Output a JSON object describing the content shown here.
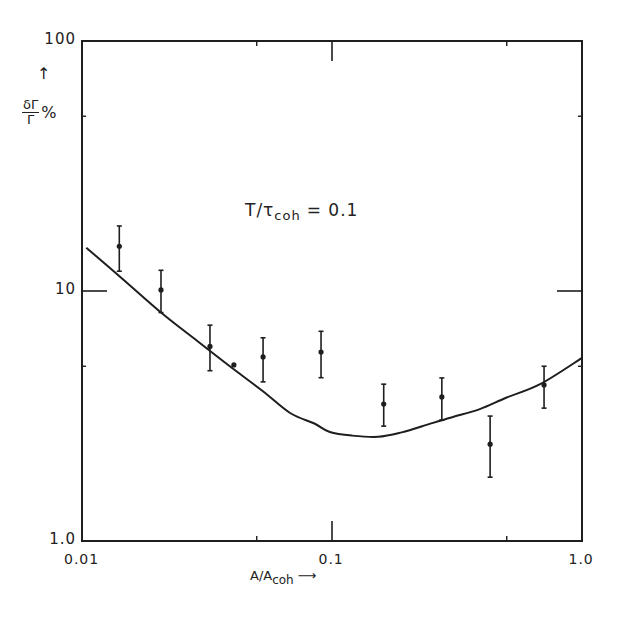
{
  "chart_data": {
    "type": "scatter",
    "title": "",
    "annotation": {
      "text": "T/τ",
      "sub": "coh",
      "suffix": "= 0.1"
    },
    "xlabel": {
      "text": "A/A",
      "sub": "coh",
      "arrow": "⟶"
    },
    "ylabel": {
      "numerator": "δΓ",
      "denominator": "Γ",
      "suffix": "%",
      "arrow": "↑"
    },
    "xscale": "log",
    "yscale": "log",
    "xlim": [
      0.01,
      1.0
    ],
    "ylim": [
      1.0,
      100
    ],
    "xticks": [
      {
        "value": 0.01,
        "label": "0.01"
      },
      {
        "value": 0.1,
        "label": "0.1"
      },
      {
        "value": 1.0,
        "label": "1.0"
      }
    ],
    "yticks": [
      {
        "value": 1.0,
        "label": "1.0"
      },
      {
        "value": 10,
        "label": "10"
      },
      {
        "value": 100,
        "label": "100"
      }
    ],
    "minor_xticks": [
      0.05,
      0.5
    ],
    "minor_yticks": [
      5,
      50
    ],
    "grid": false,
    "legend": null,
    "series": [
      {
        "name": "measured",
        "kind": "points_with_error_bars",
        "points": [
          {
            "x": 0.0141,
            "y": 15.1,
            "ylow": 12.0,
            "yhigh": 18.2
          },
          {
            "x": 0.0207,
            "y": 10.1,
            "ylow": 8.2,
            "yhigh": 12.1
          },
          {
            "x": 0.0325,
            "y": 6.0,
            "ylow": 4.8,
            "yhigh": 7.3
          },
          {
            "x": 0.0405,
            "y": 5.06,
            "ylow": null,
            "yhigh": null
          },
          {
            "x": 0.053,
            "y": 5.45,
            "ylow": 4.33,
            "yhigh": 6.5
          },
          {
            "x": 0.0904,
            "y": 5.7,
            "ylow": 4.5,
            "yhigh": 6.9
          },
          {
            "x": 0.161,
            "y": 3.53,
            "ylow": 2.88,
            "yhigh": 4.24
          },
          {
            "x": 0.275,
            "y": 3.77,
            "ylow": 3.05,
            "yhigh": 4.49
          },
          {
            "x": 0.429,
            "y": 2.44,
            "ylow": 1.8,
            "yhigh": 3.16
          },
          {
            "x": 0.705,
            "y": 4.21,
            "ylow": 3.4,
            "yhigh": 5.0
          }
        ]
      },
      {
        "name": "theory",
        "kind": "line",
        "x": [
          0.0104,
          0.0145,
          0.0207,
          0.029,
          0.039,
          0.0525,
          0.068,
          0.085,
          0.098,
          0.12,
          0.153,
          0.19,
          0.246,
          0.3,
          0.39,
          0.5,
          0.68,
          1.0
        ],
        "y": [
          14.9,
          11.2,
          8.2,
          6.3,
          5.0,
          4.0,
          3.25,
          2.95,
          2.73,
          2.64,
          2.61,
          2.72,
          2.94,
          3.12,
          3.37,
          3.75,
          4.24,
          5.4
        ]
      }
    ]
  }
}
